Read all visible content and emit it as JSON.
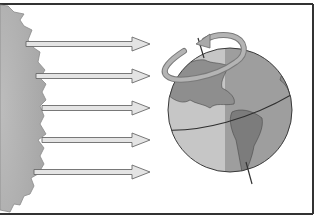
{
  "diagram": {
    "title": "",
    "elements": {
      "sun": {
        "icon": "sun-icon"
      },
      "rays": {
        "count": 5,
        "icon": "arrow-right-icon"
      },
      "earth": {
        "icon": "globe-icon",
        "axis_tilted": true
      },
      "rotation": {
        "icon": "rotation-arrow-icon",
        "direction": "counterclockwise-from-above"
      }
    },
    "colors": {
      "frame": "#333333",
      "sun_fill": "#b8b8b8",
      "sun_edge": "#8a8a8a",
      "ray_fill": "#e4e4e4",
      "ray_stroke": "#6a6a6a",
      "globe_day": "#c6c6c6",
      "globe_night": "#9a9a9a",
      "land": "#8c8c8c",
      "outline": "#3a3a3a",
      "rotation_arrow": "#a9a9a9"
    }
  }
}
